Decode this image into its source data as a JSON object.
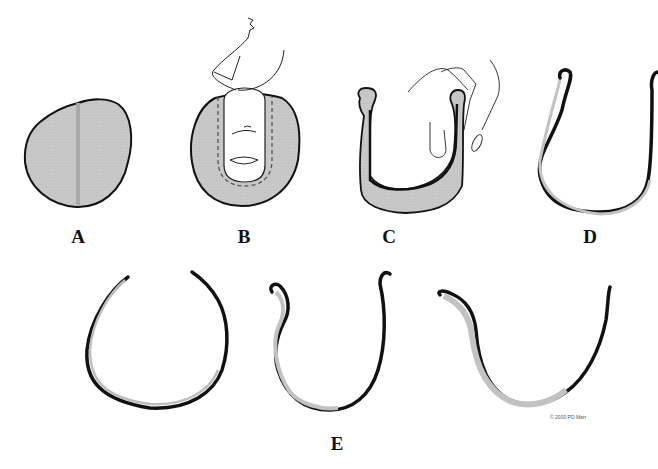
{
  "figure": {
    "panels": [
      {
        "id": "A",
        "label": "A",
        "description": "oval cartilage disc with vertical midline"
      },
      {
        "id": "B",
        "label": "B",
        "description": "finger pressing into cartilage disc, dashed outline"
      },
      {
        "id": "C",
        "label": "C",
        "description": "U-shaped cartilage bent by fingers"
      },
      {
        "id": "D",
        "label": "D",
        "description": "thin U-shaped cartilage strip"
      },
      {
        "id": "E",
        "label": "E",
        "description": "three curved cartilage strip variants"
      }
    ],
    "credit": "© 2000 PD Marr",
    "colors": {
      "fill": "#c8c8c8",
      "stroke": "#111111",
      "line": "#333333",
      "background": "#ffffff"
    }
  }
}
